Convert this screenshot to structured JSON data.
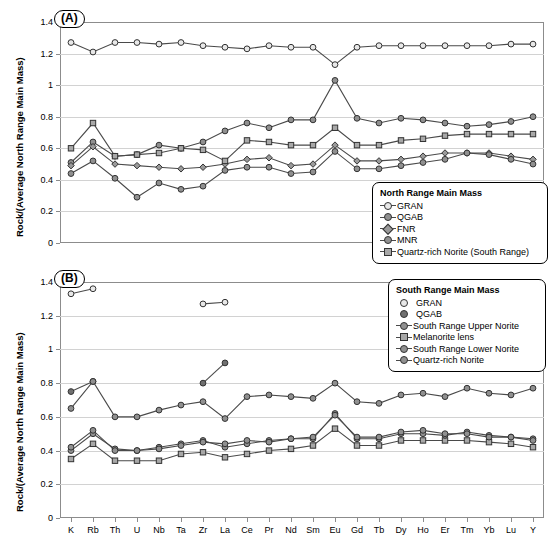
{
  "figure": {
    "ylabel": "Rock/(Average North Range Main Mass)",
    "elements": [
      "K",
      "Rb",
      "Th",
      "U",
      "Nb",
      "Ta",
      "Zr",
      "La",
      "Ce",
      "Pr",
      "Nd",
      "Sm",
      "Eu",
      "Gd",
      "Tb",
      "Dy",
      "Ho",
      "Er",
      "Tm",
      "Yb",
      "Lu",
      "Y"
    ],
    "yticks": [
      "0",
      "0.2",
      "0.4",
      "0.6",
      "0.8",
      "1",
      "1.2",
      "1.4"
    ],
    "panelA_tag": "(A)",
    "panelB_tag": "(B)"
  },
  "legendA": {
    "title": "North Range Main Mass",
    "items": [
      {
        "label": "GRAN",
        "marker": "circle-open",
        "line": true
      },
      {
        "label": "QGAB",
        "marker": "circle-filled",
        "line": true
      },
      {
        "label": "FNR",
        "marker": "diamond",
        "line": true
      },
      {
        "label": "MNR",
        "marker": "circle-filled",
        "line": true
      },
      {
        "label": "Quartz-rich Norite (South Range)",
        "marker": "square",
        "line": true
      }
    ]
  },
  "legendB": {
    "title": "South Range Main Mass",
    "items": [
      {
        "label": "GRAN",
        "marker": "circle-open",
        "line": false
      },
      {
        "label": "QGAB",
        "marker": "circle-dark",
        "line": false
      },
      {
        "label": "South Range Upper Norite",
        "marker": "circle-filled",
        "line": true
      },
      {
        "label": "Melanorite lens",
        "marker": "square",
        "line": true
      },
      {
        "label": "South Range Lower Norite",
        "marker": "circle-filled",
        "line": true
      },
      {
        "label": "Quartz-rich Norite",
        "marker": "circle-filled",
        "line": true
      }
    ]
  },
  "chart_data": [
    {
      "type": "line",
      "title": "(A) North Range Main Mass",
      "xlabel": "",
      "ylabel": "Rock/(Average North Range Main Mass)",
      "ylim": [
        0,
        1.4
      ],
      "grid": true,
      "legend_position": "inside-lower-right",
      "categories": [
        "K",
        "Rb",
        "Th",
        "U",
        "Nb",
        "Ta",
        "Zr",
        "La",
        "Ce",
        "Pr",
        "Nd",
        "Sm",
        "Eu",
        "Gd",
        "Tb",
        "Dy",
        "Ho",
        "Er",
        "Tm",
        "Yb",
        "Lu",
        "Y"
      ],
      "series": [
        {
          "name": "GRAN",
          "marker": "circle-open",
          "values": [
            1.27,
            1.21,
            1.27,
            1.27,
            1.26,
            1.27,
            1.25,
            1.24,
            1.23,
            1.25,
            1.24,
            1.24,
            1.13,
            1.24,
            1.25,
            1.25,
            1.25,
            1.25,
            1.25,
            1.25,
            1.26,
            1.26
          ]
        },
        {
          "name": "QGAB",
          "marker": "circle-filled",
          "values": [
            0.51,
            0.64,
            0.55,
            0.56,
            0.62,
            0.6,
            0.64,
            0.71,
            0.76,
            0.73,
            0.78,
            0.78,
            1.03,
            0.79,
            0.76,
            0.79,
            0.78,
            0.76,
            0.74,
            0.75,
            0.77,
            0.8
          ]
        },
        {
          "name": "FNR",
          "marker": "diamond",
          "values": [
            0.49,
            0.61,
            0.5,
            0.49,
            0.48,
            0.47,
            0.48,
            0.5,
            0.53,
            0.54,
            0.49,
            0.5,
            0.62,
            0.52,
            0.52,
            0.53,
            0.55,
            0.57,
            0.57,
            0.57,
            0.55,
            0.53
          ]
        },
        {
          "name": "MNR",
          "marker": "circle-filled",
          "values": [
            0.44,
            0.52,
            0.41,
            0.29,
            0.38,
            0.34,
            0.36,
            0.46,
            0.48,
            0.48,
            0.44,
            0.45,
            0.58,
            0.47,
            0.47,
            0.49,
            0.51,
            0.53,
            0.57,
            0.56,
            0.53,
            0.5
          ]
        },
        {
          "name": "Quartz-rich Norite (South Range)",
          "marker": "square",
          "values": [
            0.6,
            0.76,
            0.55,
            0.56,
            0.57,
            0.6,
            0.59,
            0.52,
            0.65,
            0.64,
            0.62,
            0.62,
            0.73,
            0.62,
            0.62,
            0.65,
            0.66,
            0.68,
            0.69,
            0.69,
            0.69,
            0.69
          ]
        }
      ]
    },
    {
      "type": "line",
      "title": "(B) South Range Main Mass",
      "xlabel": "",
      "ylabel": "Rock/(Average North Range Main Mass)",
      "ylim": [
        0,
        1.4
      ],
      "grid": true,
      "legend_position": "inside-upper-right",
      "categories": [
        "K",
        "Rb",
        "Th",
        "U",
        "Nb",
        "Ta",
        "Zr",
        "La",
        "Ce",
        "Pr",
        "Nd",
        "Sm",
        "Eu",
        "Gd",
        "Tb",
        "Dy",
        "Ho",
        "Er",
        "Tm",
        "Yb",
        "Lu",
        "Y"
      ],
      "series": [
        {
          "name": "GRAN",
          "marker": "circle-open",
          "line": false,
          "values": [
            1.33,
            1.36,
            null,
            null,
            null,
            null,
            1.27,
            1.28,
            null,
            null,
            null,
            null,
            null,
            null,
            null,
            null,
            null,
            null,
            null,
            null,
            null,
            1.15
          ]
        },
        {
          "name": "QGAB",
          "marker": "circle-dark",
          "line": false,
          "values": [
            0.75,
            0.81,
            null,
            null,
            null,
            null,
            0.8,
            0.92,
            null,
            null,
            null,
            null,
            null,
            null,
            null,
            null,
            null,
            null,
            null,
            null,
            null,
            1.0
          ]
        },
        {
          "name": "South Range Upper Norite",
          "marker": "circle-filled",
          "values": [
            0.65,
            0.81,
            0.6,
            0.6,
            0.64,
            0.67,
            0.69,
            0.59,
            0.72,
            0.73,
            0.72,
            0.71,
            0.8,
            0.69,
            0.68,
            0.73,
            0.74,
            0.72,
            0.77,
            0.74,
            0.73,
            0.77
          ]
        },
        {
          "name": "Melanorite lens",
          "marker": "square",
          "values": [
            0.35,
            0.44,
            0.34,
            0.34,
            0.34,
            0.38,
            0.39,
            0.36,
            0.38,
            0.4,
            0.41,
            0.43,
            0.53,
            0.43,
            0.43,
            0.46,
            0.46,
            0.46,
            0.46,
            0.45,
            0.44,
            0.42
          ]
        },
        {
          "name": "South Range Lower Norite",
          "marker": "circle-filled",
          "values": [
            0.4,
            0.5,
            0.41,
            0.4,
            0.42,
            0.44,
            0.46,
            0.42,
            0.44,
            0.46,
            0.47,
            0.47,
            0.62,
            0.47,
            0.47,
            0.5,
            0.5,
            0.49,
            0.51,
            0.49,
            0.48,
            0.47
          ]
        },
        {
          "name": "Quartz-rich Norite",
          "marker": "circle-filled",
          "values": [
            0.42,
            0.52,
            0.4,
            0.4,
            0.41,
            0.43,
            0.45,
            0.44,
            0.46,
            0.45,
            0.47,
            0.48,
            0.61,
            0.48,
            0.48,
            0.51,
            0.52,
            0.5,
            0.5,
            0.48,
            0.48,
            0.46
          ]
        }
      ]
    }
  ]
}
